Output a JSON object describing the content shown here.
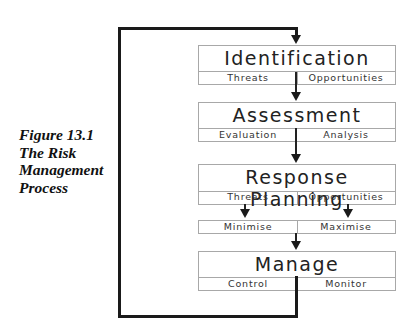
{
  "caption": {
    "line1": "Figure 13.1",
    "line2": "The Risk",
    "line3": "Management",
    "line4": "Process"
  },
  "stages": [
    {
      "title": "Identification",
      "left": "Threats",
      "right": "Opportunities"
    },
    {
      "title": "Assessment",
      "left": "Evaluation",
      "right": "Analysis"
    },
    {
      "title": "Response Planning",
      "left": "Threats",
      "right": "Opportunities"
    },
    {
      "title": "Manage",
      "left": "Control",
      "right": "Monitor"
    }
  ],
  "response_outcomes": {
    "left": "Minimise",
    "right": "Maximise"
  },
  "colors": {
    "line": "#1a1a1a",
    "box_border": "#a8a8a8",
    "text": "#222222"
  }
}
